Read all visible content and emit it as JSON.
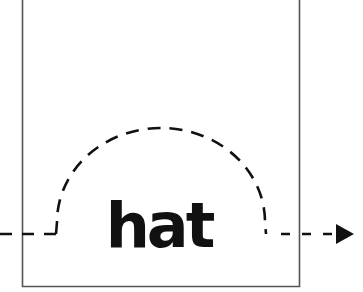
{
  "diagram": {
    "word": "hat",
    "colors": {
      "stroke": "#111111",
      "frame": "#555555",
      "background": "#ffffff"
    },
    "elements": [
      {
        "type": "open-frame",
        "description": "rectangle open at top"
      },
      {
        "type": "dashed-path",
        "description": "horizontal dashed line with semicircular dashed arc over the word"
      },
      {
        "type": "arrowhead",
        "direction": "right"
      }
    ]
  }
}
